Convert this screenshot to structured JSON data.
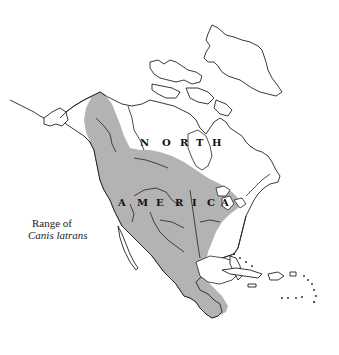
{
  "map": {
    "title": "Range of Canis latrans",
    "legend": {
      "line1": "Range of",
      "line2": "Canis latrans"
    },
    "continent_label": {
      "row1": [
        "N",
        "O",
        "R",
        "T",
        "H"
      ],
      "row2": [
        "A",
        "M",
        "E",
        "R",
        "I",
        "C",
        "A"
      ]
    },
    "colors": {
      "range_fill": "#b3b3b3",
      "coastline": "#222222",
      "background": "#ffffff"
    },
    "region": "North America",
    "species": "Canis latrans"
  }
}
